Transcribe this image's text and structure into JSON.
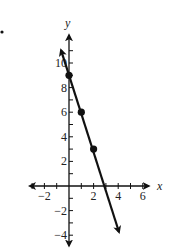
{
  "chart_data": {
    "type": "line",
    "title": "",
    "xlabel": "x",
    "ylabel": "y",
    "xlim": [
      -3.5,
      6.8
    ],
    "ylim": [
      -5,
      12.5
    ],
    "x_ticks": [
      -2,
      2,
      4,
      6
    ],
    "y_ticks": [
      10,
      8,
      6,
      4,
      2,
      -2,
      -4
    ],
    "x_tick_labels": [
      "−2",
      "2",
      "4",
      "6"
    ],
    "y_tick_labels": [
      "10",
      "8",
      "6",
      "4",
      "2",
      "−2",
      "−4"
    ],
    "grid": false,
    "legend": null,
    "series": [
      {
        "name": "y = -3x + 9",
        "equation": "y = -3x + 9",
        "points": [
          [
            0,
            9
          ],
          [
            1,
            6
          ],
          [
            2,
            3
          ]
        ],
        "line_extent": [
          [
            -0.65,
            11.05
          ],
          [
            4.05,
            -3.15
          ]
        ],
        "arrows_both_ends": true
      }
    ],
    "color": "#111111"
  },
  "geometry": {
    "origin_x": 69,
    "origin_y": 186,
    "unit": 12.3
  }
}
